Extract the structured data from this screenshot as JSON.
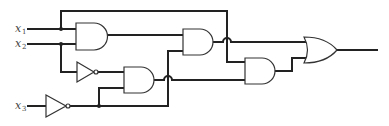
{
  "diagram": {
    "type": "logic-circuit",
    "inputs": [
      {
        "name": "x",
        "sub": "1",
        "y": 29
      },
      {
        "name": "x",
        "sub": "2",
        "y": 44
      },
      {
        "name": "x",
        "sub": "3",
        "y": 106
      }
    ],
    "gates": [
      {
        "id": "and1",
        "type": "AND",
        "inputs": [
          "x1",
          "x2"
        ]
      },
      {
        "id": "not1",
        "type": "NOT",
        "inputs": [
          "x2"
        ]
      },
      {
        "id": "not2",
        "type": "NOT",
        "inputs": [
          "x3"
        ]
      },
      {
        "id": "and2",
        "type": "AND",
        "inputs": [
          "not1",
          "not2"
        ]
      },
      {
        "id": "and3",
        "type": "AND",
        "inputs": [
          "and1",
          "not2"
        ]
      },
      {
        "id": "and4",
        "type": "AND",
        "inputs": [
          "x1",
          "and2"
        ]
      },
      {
        "id": "or1",
        "type": "OR",
        "inputs": [
          "and3",
          "and4"
        ]
      }
    ],
    "output": "or1"
  }
}
